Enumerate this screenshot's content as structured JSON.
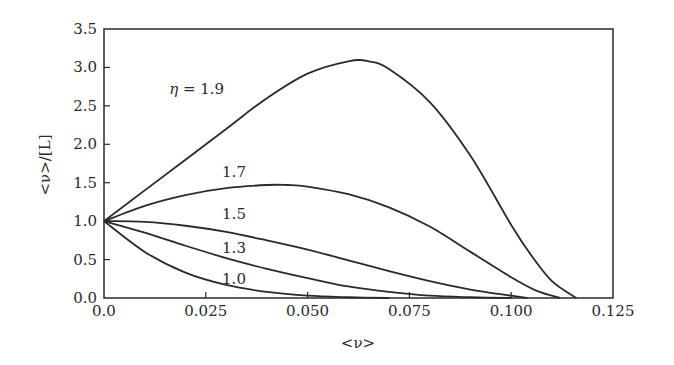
{
  "chart_data": {
    "type": "line",
    "title": "",
    "xlabel": "<ν>",
    "ylabel": "<ν>/[L]",
    "xlim": [
      0.0,
      0.125
    ],
    "ylim": [
      0.0,
      3.5
    ],
    "xticks": [
      0.0,
      0.025,
      0.05,
      0.075,
      0.1,
      0.125
    ],
    "xtick_labels": [
      "0.0",
      "0.025",
      "0.050",
      "0.075",
      "0.100",
      "0.125"
    ],
    "yticks": [
      0.0,
      0.5,
      1.0,
      1.5,
      2.0,
      2.5,
      3.0,
      3.5
    ],
    "ytick_labels": [
      "0.0",
      "0.5",
      "1.0",
      "1.5",
      "2.0",
      "2.5",
      "3.0",
      "3.5"
    ],
    "grid": false,
    "legend": "inline curve labels",
    "series": [
      {
        "name": "η = 1.9",
        "label": "η = 1.9",
        "label_pos": [
          0.016,
          2.65
        ],
        "x": [
          0,
          0.01,
          0.02,
          0.03,
          0.04,
          0.05,
          0.06,
          0.065,
          0.07,
          0.08,
          0.09,
          0.1,
          0.105,
          0.11,
          0.116
        ],
        "y": [
          1.0,
          1.4,
          1.8,
          2.2,
          2.6,
          2.92,
          3.08,
          3.08,
          2.98,
          2.55,
          1.85,
          0.95,
          0.55,
          0.22,
          0.0
        ]
      },
      {
        "name": "1.7",
        "label": "1.7",
        "label_pos": [
          0.029,
          1.58
        ],
        "x": [
          0,
          0.01,
          0.02,
          0.03,
          0.04,
          0.045,
          0.05,
          0.06,
          0.07,
          0.08,
          0.09,
          0.1,
          0.106,
          0.112
        ],
        "y": [
          1.0,
          1.2,
          1.34,
          1.43,
          1.47,
          1.47,
          1.45,
          1.35,
          1.18,
          0.93,
          0.6,
          0.27,
          0.1,
          0.0
        ]
      },
      {
        "name": "1.5",
        "label": "1.5",
        "label_pos": [
          0.029,
          1.03
        ],
        "x": [
          0,
          0.01,
          0.02,
          0.03,
          0.04,
          0.05,
          0.06,
          0.07,
          0.08,
          0.09,
          0.1,
          0.104
        ],
        "y": [
          1.0,
          0.99,
          0.94,
          0.86,
          0.75,
          0.63,
          0.49,
          0.35,
          0.22,
          0.11,
          0.03,
          0.0
        ]
      },
      {
        "name": "1.3",
        "label": "1.3",
        "label_pos": [
          0.029,
          0.58
        ],
        "x": [
          0,
          0.01,
          0.02,
          0.03,
          0.04,
          0.05,
          0.06,
          0.07,
          0.08,
          0.09,
          0.1
        ],
        "y": [
          1.0,
          0.85,
          0.68,
          0.52,
          0.38,
          0.26,
          0.15,
          0.08,
          0.03,
          0.01,
          0.0
        ]
      },
      {
        "name": "1.0",
        "label": "1.0",
        "label_pos": [
          0.029,
          0.18
        ],
        "x": [
          0,
          0.01,
          0.02,
          0.03,
          0.04,
          0.05,
          0.06,
          0.07
        ],
        "y": [
          1.0,
          0.6,
          0.33,
          0.17,
          0.08,
          0.03,
          0.01,
          0.0
        ]
      }
    ]
  },
  "plot_area": {
    "left": 104,
    "right": 613,
    "top": 29,
    "bottom": 298
  },
  "colors": {
    "line": "#2a2a2a",
    "background": "#ffffff"
  }
}
